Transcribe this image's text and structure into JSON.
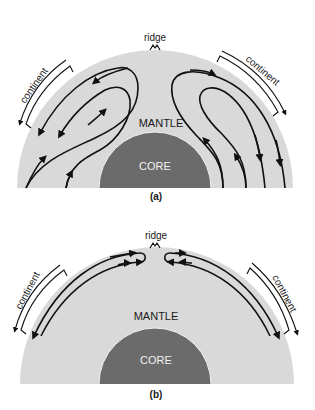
{
  "panels": [
    {
      "id": "a",
      "caption": "(a)",
      "labels": {
        "ridge": "ridge",
        "mantle": "MANTLE",
        "core": "CORE",
        "continent_left": "continent",
        "continent_right": "continent"
      },
      "description": "Two large convection cells in the mantle rising beneath the ridge and descending at the margins beneath continents"
    },
    {
      "id": "b",
      "caption": "(b)",
      "labels": {
        "ridge": "ridge",
        "mantle": "MANTLE",
        "core": "CORE",
        "continent_left": "continent",
        "continent_right": "continent"
      },
      "description": "Shallow convection cells confined to the upper mantle, flowing away from the ridge beneath continents"
    }
  ],
  "colors": {
    "mantle": "#d9d9d9",
    "core": "#6b6b6b",
    "lines": "#111111",
    "background": "#ffffff"
  }
}
